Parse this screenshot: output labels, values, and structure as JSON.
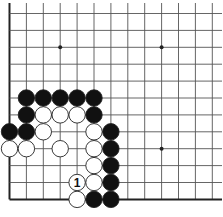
{
  "diagram": {
    "type": "go-board-fragment",
    "visible_corner": "bottom-left",
    "columns": 13,
    "rows": 12,
    "colors": {
      "background": "#ffffff",
      "grid": "#555555",
      "edge": "#222222",
      "black_stone": "#111111",
      "white_stone": "#ffffff",
      "stone_outline": "#222222"
    },
    "star_points": [
      {
        "col": 3,
        "row": 2
      },
      {
        "col": 9,
        "row": 2
      },
      {
        "col": 9,
        "row": 8
      }
    ],
    "stones": [
      {
        "col": 1,
        "row": 5,
        "color": "black"
      },
      {
        "col": 2,
        "row": 5,
        "color": "black"
      },
      {
        "col": 3,
        "row": 5,
        "color": "black"
      },
      {
        "col": 4,
        "row": 5,
        "color": "black"
      },
      {
        "col": 5,
        "row": 5,
        "color": "black"
      },
      {
        "col": 1,
        "row": 6,
        "color": "black"
      },
      {
        "col": 2,
        "row": 6,
        "color": "white"
      },
      {
        "col": 3,
        "row": 6,
        "color": "white"
      },
      {
        "col": 4,
        "row": 6,
        "color": "white"
      },
      {
        "col": 5,
        "row": 6,
        "color": "black"
      },
      {
        "col": 0,
        "row": 7,
        "color": "black"
      },
      {
        "col": 1,
        "row": 7,
        "color": "black"
      },
      {
        "col": 2,
        "row": 7,
        "color": "white"
      },
      {
        "col": 5,
        "row": 7,
        "color": "white"
      },
      {
        "col": 6,
        "row": 7,
        "color": "black"
      },
      {
        "col": 0,
        "row": 8,
        "color": "white"
      },
      {
        "col": 1,
        "row": 8,
        "color": "white"
      },
      {
        "col": 3,
        "row": 8,
        "color": "white"
      },
      {
        "col": 5,
        "row": 8,
        "color": "white"
      },
      {
        "col": 6,
        "row": 8,
        "color": "black"
      },
      {
        "col": 5,
        "row": 9,
        "color": "white"
      },
      {
        "col": 6,
        "row": 9,
        "color": "black"
      },
      {
        "col": 4,
        "row": 10,
        "color": "white",
        "label": "1"
      },
      {
        "col": 5,
        "row": 10,
        "color": "white"
      },
      {
        "col": 6,
        "row": 10,
        "color": "black"
      },
      {
        "col": 4,
        "row": 11,
        "color": "white"
      },
      {
        "col": 5,
        "row": 11,
        "color": "black"
      },
      {
        "col": 6,
        "row": 11,
        "color": "black"
      }
    ]
  }
}
